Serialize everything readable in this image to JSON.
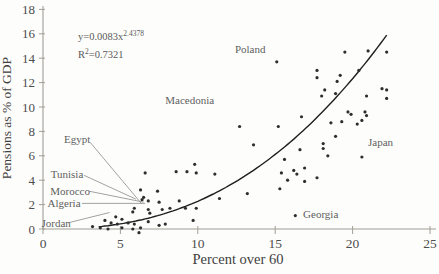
{
  "chart_data": {
    "type": "scatter",
    "title": "",
    "xlabel": "Percent over 60",
    "ylabel": "Pensions as % of GDP",
    "xlim": [
      0,
      25
    ],
    "ylim": [
      0,
      18
    ],
    "xticks": [
      0,
      5,
      10,
      15,
      20,
      25
    ],
    "yticks": [
      0,
      2,
      4,
      6,
      8,
      10,
      12,
      14,
      16,
      18
    ],
    "grid": false,
    "legend": "none",
    "equation": {
      "base": "y=0.0083x",
      "exponent": "2.4378",
      "r2_base": "R",
      "r2_sup": "2",
      "r2_rest": "=0.7321",
      "x": 2.26,
      "y_eq": 15.5,
      "y_r2": 14.0
    },
    "trendline": {
      "kind": "power",
      "a": 0.0083,
      "b": 2.4378,
      "x_start": 3.6,
      "x_end": 22.2
    },
    "points": [
      [
        3.2,
        0.2
      ],
      [
        3.7,
        0.1
      ],
      [
        4.0,
        0.7
      ],
      [
        4.2,
        0.0
      ],
      [
        4.4,
        0.5
      ],
      [
        4.7,
        1.0
      ],
      [
        4.8,
        0.4
      ],
      [
        5.1,
        0.8
      ],
      [
        5.1,
        0.1
      ],
      [
        5.5,
        0.5
      ],
      [
        5.8,
        0.0
      ],
      [
        5.8,
        1.4
      ],
      [
        5.9,
        1.7
      ],
      [
        5.9,
        0.4
      ],
      [
        6.2,
        -0.3
      ],
      [
        6.3,
        0.1
      ],
      [
        6.3,
        3.2
      ],
      [
        6.4,
        2.4
      ],
      [
        6.5,
        2.6
      ],
      [
        6.8,
        2.3
      ],
      [
        6.8,
        1.6
      ],
      [
        6.8,
        0.6
      ],
      [
        6.9,
        1.3
      ],
      [
        7.4,
        3.1
      ],
      [
        7.5,
        2.2
      ],
      [
        7.5,
        0.3
      ],
      [
        7.7,
        1.6
      ],
      [
        7.9,
        0.4
      ],
      [
        8.2,
        1.7
      ],
      [
        8.8,
        2.3
      ],
      [
        9.2,
        1.7
      ],
      [
        9.7,
        0.7
      ],
      [
        9.9,
        1.7
      ],
      [
        6.6,
        4.6
      ],
      [
        8.6,
        4.7
      ],
      [
        9.3,
        4.7
      ],
      [
        9.8,
        5.3
      ],
      [
        9.9,
        4.6
      ],
      [
        11.1,
        4.5
      ],
      [
        11.4,
        2.5
      ],
      [
        13.2,
        2.9
      ],
      [
        15.3,
        3.3
      ],
      [
        16.3,
        1.1
      ],
      [
        12.7,
        8.4
      ],
      [
        13.6,
        6.9
      ],
      [
        15.2,
        8.4
      ],
      [
        15.6,
        5.7
      ],
      [
        16.6,
        6.5
      ],
      [
        15.4,
        4.6
      ],
      [
        16.2,
        4.8
      ],
      [
        16.4,
        4.5
      ],
      [
        16.9,
        5.0
      ],
      [
        15.8,
        4.0
      ],
      [
        16.9,
        3.9
      ],
      [
        17.7,
        4.2
      ],
      [
        18.1,
        6.6
      ],
      [
        18.4,
        6.0
      ],
      [
        20.6,
        5.9
      ],
      [
        18.1,
        7.0
      ],
      [
        18.9,
        7.6
      ],
      [
        16.7,
        9.2
      ],
      [
        15.1,
        13.7
      ],
      [
        17.7,
        13.0
      ],
      [
        17.7,
        12.4
      ],
      [
        18.0,
        10.9
      ],
      [
        19.5,
        14.5
      ],
      [
        21.0,
        14.6
      ],
      [
        22.2,
        14.5
      ],
      [
        20.4,
        13.0
      ],
      [
        19.2,
        12.6
      ],
      [
        19.0,
        12.1
      ],
      [
        18.2,
        11.4
      ],
      [
        18.9,
        11.1
      ],
      [
        21.9,
        11.5
      ],
      [
        22.2,
        11.4
      ],
      [
        20.9,
        10.9
      ],
      [
        22.2,
        10.7
      ],
      [
        19.7,
        9.6
      ],
      [
        19.9,
        9.4
      ],
      [
        20.8,
        9.6
      ],
      [
        20.9,
        9.3
      ],
      [
        20.6,
        8.9
      ],
      [
        19.3,
        8.8
      ],
      [
        20.3,
        8.6
      ],
      [
        18.6,
        8.7
      ]
    ],
    "annotations": [
      {
        "label": "Poland",
        "x": 12.4,
        "y": 14.7,
        "anchor": "start"
      },
      {
        "label": "Macedonia",
        "x": 7.9,
        "y": 10.55,
        "anchor": "start"
      },
      {
        "label": "Japan",
        "x": 21.0,
        "y": 7.05,
        "anchor": "start"
      },
      {
        "label": "Georgia",
        "x": 16.8,
        "y": 1.15,
        "anchor": "start"
      },
      {
        "label": "Egypt",
        "x": 2.2,
        "y": 7.35,
        "anchor": "middle",
        "leader": [
          3.05,
          7.1,
          6.35,
          2.1
        ]
      },
      {
        "label": "Tunisia",
        "x": 1.55,
        "y": 4.5,
        "anchor": "middle",
        "leader": [
          2.65,
          4.4,
          6.0,
          2.45
        ]
      },
      {
        "label": "Morocco",
        "x": 1.75,
        "y": 3.1,
        "anchor": "middle",
        "leader": [
          2.97,
          3.1,
          6.5,
          2.2
        ]
      },
      {
        "label": "Algeria",
        "x": 1.36,
        "y": 2.13,
        "anchor": "middle",
        "leader": [
          2.52,
          2.1,
          6.6,
          2.1
        ]
      },
      {
        "label": "Jordan",
        "x": 0.85,
        "y": 0.45,
        "anchor": "middle",
        "leader": [
          1.6,
          0.5,
          4.3,
          1.35
        ]
      }
    ],
    "colors": {
      "background": "#fdfdfb",
      "axis": "#a29e95",
      "tick_text": "#4d4d4d",
      "axis_title": "#3f3f3f",
      "point": "#2e2e2e",
      "curve": "#1f1f1f",
      "annotation_text": "#5f5f5f",
      "leader_line": "#8a8a8a",
      "equation_text": "#5a5a5a"
    }
  }
}
